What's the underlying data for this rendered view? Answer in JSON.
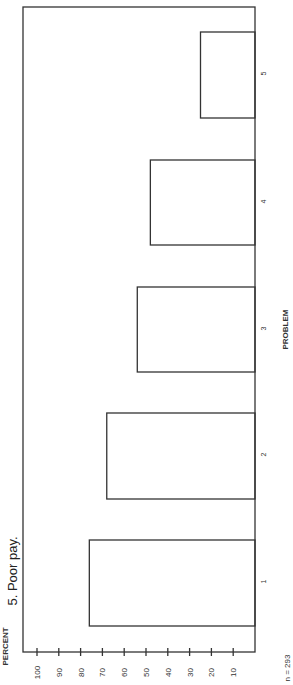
{
  "chart_data": {
    "type": "bar",
    "orientation": "rotated-90-ccw (vertical bar chart printed sideways)",
    "title": "5. Poor pay.",
    "xlabel": "PROBLEM",
    "ylabel": "PERCENT",
    "categories": [
      "1",
      "2",
      "3",
      "4",
      "5"
    ],
    "values": [
      76,
      68,
      54,
      48,
      25
    ],
    "ylim": [
      0,
      100
    ],
    "yticks": [
      10,
      20,
      30,
      40,
      50,
      60,
      70,
      80,
      90,
      100
    ],
    "grid": false,
    "legend": null,
    "annotation": "n = 293"
  },
  "labels": {
    "title": "5. Poor pay.",
    "ylabel": "PERCENT",
    "xlabel": "PROBLEM",
    "n": "n = 293"
  },
  "colors": {
    "line": "#333333",
    "background": "#ffffff"
  }
}
